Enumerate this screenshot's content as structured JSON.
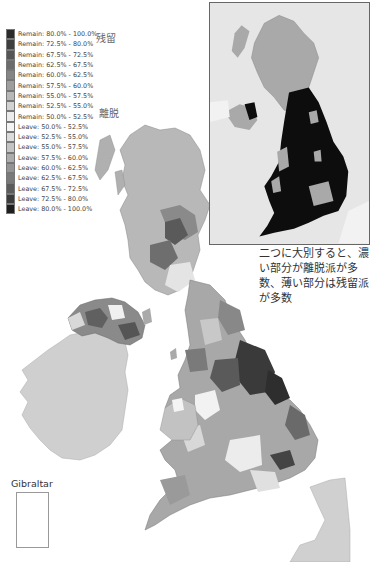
{
  "map": {
    "title": "EU referendum result by voting area (grayscale)",
    "legend": [
      {
        "label": "Remain: 80.0% - 100.0%",
        "color": "#2a2a2a"
      },
      {
        "label": "Remain: 72.5% - 80.0%",
        "color": "#3e3e3e"
      },
      {
        "label": "Remain: 67.5% - 72.5%",
        "color": "#555555"
      },
      {
        "label": "Remain: 62.5% - 67.5%",
        "color": "#6c6c6c"
      },
      {
        "label": "Remain: 60.0% - 62.5%",
        "color": "#858585"
      },
      {
        "label": "Remain: 57.5% - 60.0%",
        "color": "#9e9e9e"
      },
      {
        "label": "Remain: 55.0% - 57.5%",
        "color": "#b8b8b8"
      },
      {
        "label": "Remain: 52.5% - 55.0%",
        "color": "#d2d2d2"
      },
      {
        "label": "Remain: 50.0% - 52.5%",
        "color": "#ececec"
      },
      {
        "label": "Leave: 50.0% - 52.5%",
        "color": "#f4f4f4"
      },
      {
        "label": "Leave: 52.5% - 55.0%",
        "color": "#dcdcdc"
      },
      {
        "label": "Leave: 55.0% - 57.5%",
        "color": "#c4c4c4"
      },
      {
        "label": "Leave: 57.5% - 60.0%",
        "color": "#acacac"
      },
      {
        "label": "Leave: 60.0% - 62.5%",
        "color": "#949494"
      },
      {
        "label": "Leave: 62.5% - 67.5%",
        "color": "#7a7a7a"
      },
      {
        "label": "Leave: 67.5% - 72.5%",
        "color": "#5c5c5c"
      },
      {
        "label": "Leave: 72.5% - 80.0%",
        "color": "#3c3c3c"
      },
      {
        "label": "Leave: 80.0% - 100.0%",
        "color": "#1e1e1e"
      }
    ],
    "labels": {
      "remain_jp": "残留",
      "leave_jp": "離脱"
    },
    "annotation": "二つに大別すると、濃い部分が離脱派が多数、薄い部分は残留派が多数",
    "inset_label": "",
    "gibraltar_label": "Gibraltar",
    "colors": {
      "sea": "#ffffff",
      "ireland": "#cfcfcf",
      "france": "#d0d0d0",
      "inset_bg": "#e6e6e6",
      "inset_remain": "#a9a9a9",
      "inset_leave": "#0d0d0d"
    }
  }
}
